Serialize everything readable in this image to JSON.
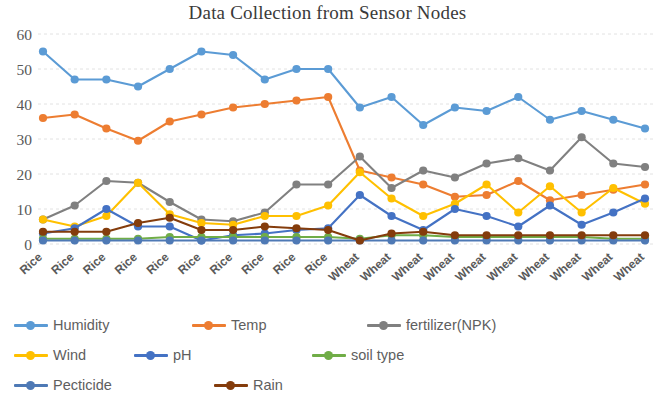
{
  "chart_data": {
    "type": "line",
    "title": "Data Collection from Sensor Nodes",
    "xlabel": "",
    "ylabel": "",
    "ylim": [
      0,
      60
    ],
    "yticks": [
      0,
      10,
      20,
      30,
      40,
      50,
      60
    ],
    "grid": true,
    "legend_position": "bottom",
    "categories": [
      "Rice",
      "Rice",
      "Rice",
      "Rice",
      "Rice",
      "Rice",
      "Rice",
      "Rice",
      "Rice",
      "Rice",
      "Wheat",
      "Wheat",
      "Wheat",
      "Wheat",
      "Wheat",
      "Wheat",
      "Wheat",
      "Wheat",
      "Wheat",
      "Wheat"
    ],
    "series": [
      {
        "name": "Humidity",
        "color": "#5B9BD5",
        "values": [
          55,
          47,
          47,
          45,
          50,
          55,
          54,
          47,
          50,
          50,
          39,
          42,
          34,
          39,
          38,
          42,
          35.5,
          38,
          35.5,
          33
        ]
      },
      {
        "name": "Temp",
        "color": "#ED7D31",
        "values": [
          36,
          37,
          33,
          29.5,
          35,
          37,
          39,
          40,
          41,
          42,
          21,
          19,
          17,
          13.5,
          14,
          18,
          12.5,
          14,
          15.5,
          17
        ]
      },
      {
        "name": "fertilizer(NPK)",
        "color": "#808080",
        "values": [
          7,
          11,
          18,
          17.5,
          12,
          7,
          6.5,
          9,
          17,
          17,
          25,
          16,
          21,
          19,
          23,
          24.5,
          21,
          30.5,
          23,
          22
        ]
      },
      {
        "name": "Wind",
        "color": "#FFC000",
        "values": [
          7,
          5,
          8,
          17.5,
          8.5,
          6,
          5.5,
          8,
          8,
          11,
          20.5,
          13,
          8,
          11.5,
          17,
          9,
          16.5,
          9,
          16,
          11.5
        ]
      },
      {
        "name": "pH",
        "color": "#4472C4",
        "values": [
          3,
          4.5,
          10,
          5,
          5,
          1,
          2.5,
          3,
          4,
          4.5,
          14,
          8,
          4,
          10,
          8,
          5,
          11,
          5.5,
          9,
          13
        ]
      },
      {
        "name": "soil type",
        "color": "#70AD47",
        "values": [
          1.5,
          1.5,
          1.5,
          1.5,
          2,
          2,
          2,
          2,
          2,
          2,
          1.5,
          2.5,
          2.5,
          2,
          2,
          2,
          2,
          2,
          1.5,
          1.5
        ]
      },
      {
        "name": "Pecticide",
        "color": "#4E79B5",
        "values": [
          1,
          1,
          1,
          1,
          1,
          1,
          1,
          1,
          1,
          1,
          1,
          1,
          1,
          1,
          1,
          1,
          1,
          1,
          1,
          1
        ]
      },
      {
        "name": "Rain",
        "color": "#843C0C",
        "values": [
          3.5,
          3.5,
          3.5,
          6,
          7.5,
          4,
          4,
          5,
          4.5,
          4,
          1,
          3,
          3.5,
          2.5,
          2.5,
          2.5,
          2.5,
          2.5,
          2.5,
          2.5
        ]
      }
    ]
  }
}
